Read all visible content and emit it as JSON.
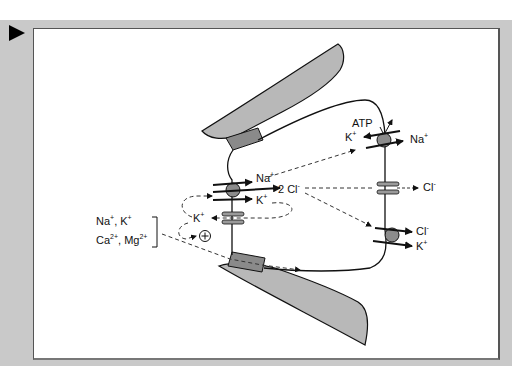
{
  "figure": {
    "marker_icon": "play-triangle-icon",
    "labels": {
      "nkcc_na": "Na",
      "nkcc_na_sup": "+",
      "nkcc_cl": "2 Cl",
      "nkcc_cl_sup": "-",
      "nkcc_k": "K",
      "nkcc_k_sup": "+",
      "atp": "ATP",
      "pump_k": "K",
      "pump_k_sup": "+",
      "pump_na": "Na",
      "pump_na_sup": "+",
      "channel_cl": "Cl",
      "channel_cl_sup": "-",
      "kcc_cl": "Cl",
      "kcc_cl_sup": "-",
      "kcc_k": "K",
      "kcc_k_sup": "+",
      "k_recycle": "K",
      "k_recycle_sup": "+",
      "plus_symbol": "+",
      "para_line1_a": "Na",
      "para_line1_a_sup": "+",
      "para_line1_sep": ", K",
      "para_line1_b_sup": "+",
      "para_line2_a": "Ca",
      "para_line2_a_sup": "2+",
      "para_line2_sep": ", Mg",
      "para_line2_b_sup": "2+"
    },
    "colors": {
      "frame": "#c9c9c9",
      "panel": "#ffffff",
      "tissue_fill": "#b8b8b8",
      "junction_fill": "#8a8a8a",
      "transporter_fill": "#8c8c8c",
      "channel_fill": "#9a9a9a",
      "stroke": "#111111"
    }
  }
}
